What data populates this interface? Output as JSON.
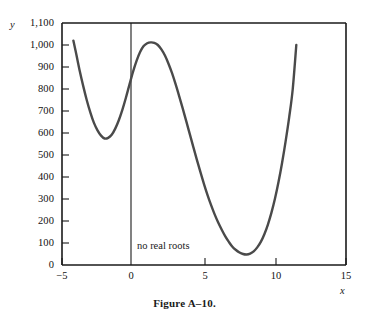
{
  "figure": {
    "caption": "Figure A–10."
  },
  "axes": {
    "y_title": "y",
    "x_title": "x",
    "y_ticks": [
      "1,100",
      "1,000",
      "900",
      "800",
      "700",
      "600",
      "500",
      "400",
      "300",
      "200",
      "100",
      "0"
    ],
    "y_tick_values": [
      1100,
      1000,
      900,
      800,
      700,
      600,
      500,
      400,
      300,
      200,
      100,
      0
    ],
    "x_ticks": [
      "−5",
      "0",
      "5",
      "10",
      "15"
    ],
    "x_tick_values": [
      -5,
      0,
      5,
      10,
      15
    ]
  },
  "annotations": {
    "no_real_roots": "no real roots"
  },
  "colors": {
    "curve": "#4a4a4a",
    "axis": "#1a1a1a",
    "background": "#ffffff"
  },
  "chart_data": {
    "type": "line",
    "title": "Figure A–10.",
    "xlabel": "x",
    "ylabel": "y",
    "xlim": [
      -5,
      15
    ],
    "ylim": [
      0,
      1100
    ],
    "grid": false,
    "legend": null,
    "xticks": [
      -5,
      0,
      5,
      10,
      15
    ],
    "yticks": [
      0,
      100,
      200,
      300,
      400,
      500,
      600,
      700,
      800,
      900,
      1000,
      1100
    ],
    "annotations": [
      {
        "text": "no real roots",
        "x": 0.4,
        "y": 95
      }
    ],
    "features": {
      "local_minimum_left": {
        "x": -2.0,
        "y": 575
      },
      "local_maximum": {
        "x": 1.5,
        "y": 1010
      },
      "global_minimum": {
        "x": 7.8,
        "y": 50
      },
      "left_endpoint": {
        "x": -4.2,
        "y": 1020
      },
      "right_endpoint": {
        "x": 11.5,
        "y": 1000
      }
    },
    "series": [
      {
        "name": "quartic curve",
        "x": [
          -4.2,
          -4.0,
          -3.75,
          -3.5,
          -3.25,
          -3.0,
          -2.75,
          -2.5,
          -2.25,
          -2.0,
          -1.75,
          -1.5,
          -1.25,
          -1.0,
          -0.75,
          -0.5,
          -0.25,
          0.0,
          0.25,
          0.5,
          0.75,
          1.0,
          1.25,
          1.5,
          1.75,
          2.0,
          2.25,
          2.5,
          2.75,
          3.0,
          3.25,
          3.5,
          3.75,
          4.0,
          4.25,
          4.5,
          4.75,
          5.0,
          5.25,
          5.5,
          5.75,
          6.0,
          6.25,
          6.5,
          6.75,
          7.0,
          7.25,
          7.5,
          7.75,
          8.0,
          8.25,
          8.5,
          8.75,
          9.0,
          9.25,
          9.5,
          9.75,
          10.0,
          10.25,
          10.5,
          10.75,
          11.0,
          11.25,
          11.5
        ],
        "y": [
          1020,
          960,
          882,
          812,
          748,
          693,
          646,
          612,
          588,
          575,
          578,
          592,
          620,
          658,
          705,
          760,
          820,
          878,
          928,
          968,
          995,
          1008,
          1012,
          1010,
          1000,
          980,
          952,
          915,
          872,
          822,
          768,
          712,
          654,
          595,
          536,
          478,
          422,
          368,
          318,
          272,
          230,
          193,
          160,
          130,
          105,
          83,
          68,
          57,
          50,
          48,
          52,
          62,
          80,
          105,
          140,
          184,
          238,
          302,
          378,
          465,
          563,
          672,
          800,
          1000
        ]
      }
    ]
  }
}
